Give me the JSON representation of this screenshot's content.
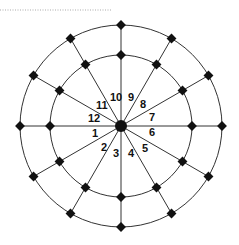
{
  "diagram": {
    "type": "radial-grid",
    "center": [
      121,
      126
    ],
    "inner_radius": 71,
    "outer_radius": 101,
    "spoke_count": 12,
    "line_color": "#333333",
    "node_color": "#111111",
    "center_node_radius": 6,
    "labels": [
      {
        "text": "1",
        "x": 92,
        "y": 137
      },
      {
        "text": "2",
        "x": 101,
        "y": 151
      },
      {
        "text": "3",
        "x": 113,
        "y": 157
      },
      {
        "text": "4",
        "x": 128,
        "y": 157
      },
      {
        "text": "5",
        "x": 142,
        "y": 152
      },
      {
        "text": "6",
        "x": 149,
        "y": 136
      },
      {
        "text": "7",
        "x": 149,
        "y": 121
      },
      {
        "text": "8",
        "x": 140,
        "y": 108
      },
      {
        "text": "9",
        "x": 128,
        "y": 101
      },
      {
        "text": "10",
        "x": 110,
        "y": 101
      },
      {
        "text": "11",
        "x": 96,
        "y": 109
      },
      {
        "text": "12",
        "x": 88,
        "y": 122
      }
    ]
  },
  "header_rule": {
    "x1": 0,
    "x2": 112,
    "y": 10,
    "style": "dotted"
  }
}
